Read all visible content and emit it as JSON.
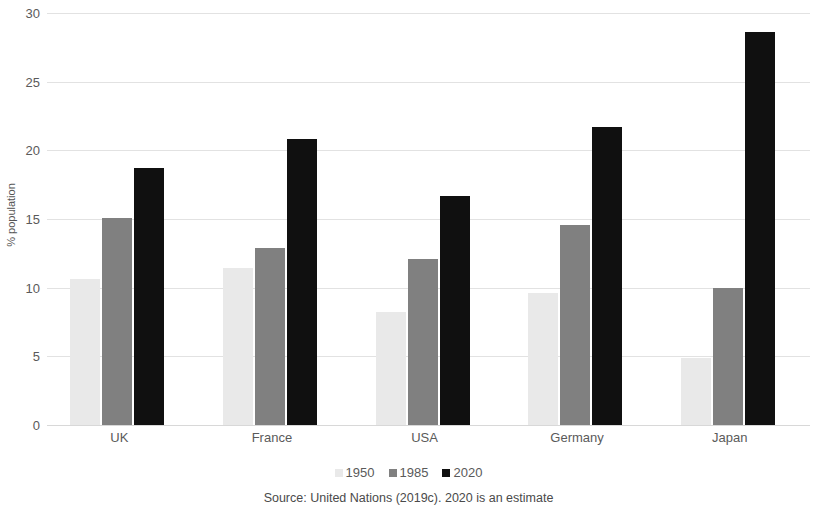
{
  "chart_data": {
    "type": "bar",
    "title": "",
    "subtitle": "",
    "xlabel": "",
    "ylabel": "% population",
    "ylim": [
      0,
      30
    ],
    "yticks": [
      0,
      5,
      10,
      15,
      20,
      25,
      30
    ],
    "grid": true,
    "legend_position": "bottom",
    "categories": [
      "UK",
      "France",
      "USA",
      "Germany",
      "Japan"
    ],
    "series": [
      {
        "name": "1950",
        "color": "#e9e9e9",
        "values": [
          10.6,
          11.4,
          8.2,
          9.6,
          4.9
        ]
      },
      {
        "name": "1985",
        "color": "#808080",
        "values": [
          15.1,
          12.9,
          12.1,
          14.6,
          10.0
        ]
      },
      {
        "name": "2020",
        "color": "#101010",
        "values": [
          18.7,
          20.8,
          16.7,
          21.7,
          28.6
        ]
      }
    ],
    "source_note": "Source: United Nations (2019c).  2020 is an estimate"
  },
  "axis": {
    "y_title": "% population",
    "tick_labels": [
      "0",
      "5",
      "10",
      "15",
      "20",
      "25",
      "30"
    ]
  },
  "legend": {
    "items": [
      {
        "label": "1950"
      },
      {
        "label": "1985"
      },
      {
        "label": "2020"
      }
    ]
  },
  "footer": {
    "source": "Source: United Nations (2019c).  2020 is an estimate"
  }
}
